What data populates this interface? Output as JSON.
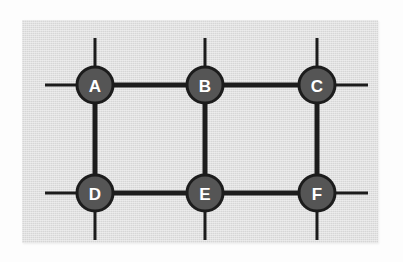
{
  "diagram": {
    "type": "node-link-graph",
    "panel": {
      "background_color": "#dcdcdc",
      "x": 22,
      "y": 20,
      "width": 356,
      "height": 223
    },
    "style": {
      "node_fill": "#555555",
      "node_stroke": "#1c1c1c",
      "node_radius": 18,
      "node_stroke_width": 3,
      "label_color": "#ffffff",
      "edge_color": "#1c1c1c",
      "edge_width": 5,
      "stub_width": 3
    },
    "nodes": [
      {
        "id": "A",
        "label": "A",
        "x": 95,
        "y": 85
      },
      {
        "id": "B",
        "label": "B",
        "x": 205,
        "y": 85
      },
      {
        "id": "C",
        "label": "C",
        "x": 317,
        "y": 85
      },
      {
        "id": "D",
        "label": "D",
        "x": 95,
        "y": 193
      },
      {
        "id": "E",
        "label": "E",
        "x": 205,
        "y": 193
      },
      {
        "id": "F",
        "label": "F",
        "x": 317,
        "y": 193
      }
    ],
    "edges": [
      {
        "from": "A",
        "to": "B"
      },
      {
        "from": "B",
        "to": "C"
      },
      {
        "from": "A",
        "to": "D"
      },
      {
        "from": "B",
        "to": "E"
      },
      {
        "from": "C",
        "to": "F"
      },
      {
        "from": "D",
        "to": "E"
      },
      {
        "from": "E",
        "to": "F"
      }
    ],
    "stubs": [
      {
        "node": "A",
        "direction": "up",
        "x1": 95,
        "y1": 67,
        "x2": 95,
        "y2": 38
      },
      {
        "node": "A",
        "direction": "left",
        "x1": 77,
        "y1": 85,
        "x2": 45,
        "y2": 85
      },
      {
        "node": "B",
        "direction": "up",
        "x1": 205,
        "y1": 67,
        "x2": 205,
        "y2": 38
      },
      {
        "node": "C",
        "direction": "up",
        "x1": 317,
        "y1": 67,
        "x2": 317,
        "y2": 38
      },
      {
        "node": "C",
        "direction": "right",
        "x1": 335,
        "y1": 85,
        "x2": 368,
        "y2": 85
      },
      {
        "node": "D",
        "direction": "left",
        "x1": 77,
        "y1": 193,
        "x2": 45,
        "y2": 193
      },
      {
        "node": "D",
        "direction": "down",
        "x1": 95,
        "y1": 211,
        "x2": 95,
        "y2": 240
      },
      {
        "node": "E",
        "direction": "left",
        "x1": 187,
        "y1": 193,
        "x2": 160,
        "y2": 193
      },
      {
        "node": "E",
        "direction": "down",
        "x1": 205,
        "y1": 211,
        "x2": 205,
        "y2": 240
      },
      {
        "node": "F",
        "direction": "right",
        "x1": 335,
        "y1": 193,
        "x2": 368,
        "y2": 193
      },
      {
        "node": "F",
        "direction": "down",
        "x1": 317,
        "y1": 211,
        "x2": 317,
        "y2": 240
      }
    ]
  }
}
